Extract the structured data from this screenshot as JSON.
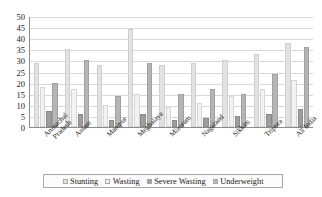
{
  "chart_data": {
    "type": "bar",
    "title": "",
    "subtitle": "",
    "xlabel": "",
    "ylabel": "",
    "ylim": [
      0,
      50
    ],
    "ytick_step": 5,
    "yticks": [
      "50",
      "45",
      "40",
      "35",
      "30",
      "25",
      "20",
      "15",
      "10",
      "5",
      "0"
    ],
    "grid": true,
    "grid_axis": "y",
    "legend_position": "bottom",
    "categories": [
      "Arunachal Pradesh",
      "Assam",
      "Manipur",
      "Meghalaya",
      "Mizoram",
      "Nagaland",
      "Sikkim",
      "Tripura",
      "All India"
    ],
    "category_lines": [
      [
        "Arunachal",
        "Pradesh"
      ],
      [
        "Assam",
        ""
      ],
      [
        "Manipur",
        ""
      ],
      [
        "Meghalaya",
        ""
      ],
      [
        "Mizoram",
        ""
      ],
      [
        "Nagaland",
        ""
      ],
      [
        "Sikkim",
        ""
      ],
      [
        "Tripura",
        ""
      ],
      [
        "All India",
        ""
      ]
    ],
    "series": [
      {
        "name": "Stunting",
        "color": "#e2e2e2",
        "values": [
          29,
          35,
          28,
          44,
          28,
          29,
          30,
          33,
          38
        ]
      },
      {
        "name": "Wasting",
        "color": "#f2f2f2",
        "values": [
          18,
          17,
          10,
          15,
          9,
          11,
          14,
          17,
          21
        ]
      },
      {
        "name": "Severe Wasting",
        "color": "#9e9e9e",
        "values": [
          7,
          6,
          3,
          6,
          3,
          4,
          5,
          6,
          8
        ]
      },
      {
        "name": "Underweight",
        "color": "#b5b5b5",
        "values": [
          20,
          30,
          14,
          29,
          15,
          17,
          15,
          24,
          36
        ]
      }
    ]
  }
}
